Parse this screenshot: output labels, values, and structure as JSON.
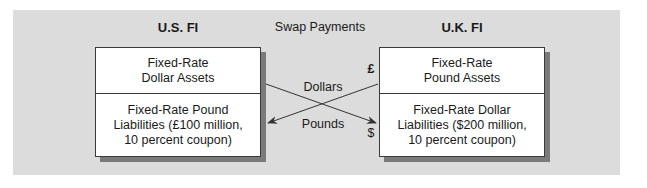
{
  "diagram": {
    "title_center": "Swap Payments",
    "left_party": {
      "name": "U.S. FI",
      "assets": [
        "Fixed-Rate",
        "Dollar Assets"
      ],
      "liabilities": [
        "Fixed-Rate Pound",
        "Liabilities (£100 million,",
        "10 percent coupon)"
      ]
    },
    "right_party": {
      "name": "U.K. FI",
      "assets": [
        "Fixed-Rate",
        "Pound Assets"
      ],
      "liabilities": [
        "Fixed-Rate Dollar",
        "Liabilities ($200 million,",
        "10 percent coupon)"
      ]
    },
    "flows": [
      {
        "label": "Dollars",
        "from": "U.S. FI assets",
        "to": "U.K. FI liabilities",
        "currency_symbol": "$"
      },
      {
        "label": "Pounds",
        "from": "U.K. FI assets",
        "to": "U.S. FI liabilities",
        "currency_symbol": "£"
      }
    ],
    "colors": {
      "background": "#dcdcdc",
      "box": "#ffffff",
      "shadow": "#7a7a7a",
      "line": "#333333"
    }
  }
}
